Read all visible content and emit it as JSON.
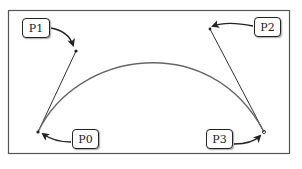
{
  "diagram": {
    "colors": {
      "frame": "#555555",
      "curve": "#666666",
      "handle": "#333333",
      "arrow": "#222222"
    },
    "points": [
      {
        "id": "P0",
        "label": "P0",
        "x": 38,
        "y": 132,
        "box": {
          "x": 72,
          "y": 129,
          "w": 27,
          "h": 20
        }
      },
      {
        "id": "P1",
        "label": "P1",
        "x": 76,
        "y": 51,
        "box": {
          "x": 22,
          "y": 18,
          "w": 28,
          "h": 20
        }
      },
      {
        "id": "P2",
        "label": "P2",
        "x": 210,
        "y": 29,
        "box": {
          "x": 254,
          "y": 17,
          "w": 27,
          "h": 20
        }
      },
      {
        "id": "P3",
        "label": "P3",
        "x": 264,
        "y": 132,
        "box": {
          "x": 206,
          "y": 129,
          "w": 27,
          "h": 20
        }
      }
    ]
  }
}
